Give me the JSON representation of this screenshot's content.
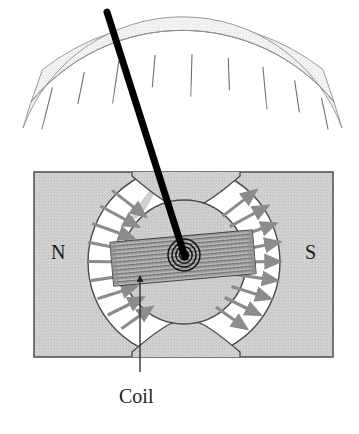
{
  "figure": {
    "labels": {
      "north_pole": "N",
      "south_pole": "S",
      "coil": "Coil"
    },
    "colors": {
      "magnet_fill": "#cfcfcf",
      "magnet_stroke": "#555555",
      "core_fill": "#cdcdcd",
      "core_stroke": "#4a4a4a",
      "coil_fill": "#b6b6b6",
      "coil_stroke": "#3a3a3a",
      "arrow": "#8c8c8c",
      "scale_fill": "#f2f2f2",
      "scale_stroke": "#8e8e8e",
      "needle": "#000000",
      "leader_line": "#222222",
      "background": "#ffffff"
    },
    "scale": {
      "name": "meter-scale-arc",
      "tick_count": 9,
      "arc_center_x": 180,
      "arc_center_y": 268,
      "outer_radius": 228,
      "inner_radius": 196,
      "start_angle_deg": 233,
      "end_angle_deg": 307
    },
    "needle": {
      "name": "meter-needle",
      "tip_x": 107,
      "tip_y": 12,
      "pivot_x": 184,
      "pivot_y": 255,
      "width": 7
    },
    "magnet": {
      "x": 34,
      "y": 172,
      "width": 299,
      "height": 185
    },
    "core": {
      "center_x": 184,
      "center_y": 262,
      "outer_radius": 96,
      "inner_radius": 62
    },
    "coil": {
      "center_x": 183,
      "center_y": 258,
      "length": 143,
      "thickness": 44,
      "tilt_deg": -5,
      "stripe_count": 11
    },
    "field_arrows": {
      "left_count": 9,
      "right_count": 9,
      "direction_left": "inward-toward-core",
      "direction_right": "outward-from-core"
    },
    "pivot_spiral": {
      "ring_count": 4,
      "max_radius": 16
    },
    "leader": {
      "name": "coil-leader-arrow",
      "from_x": 140,
      "from_y": 372,
      "to_x": 140,
      "to_y": 272
    }
  }
}
